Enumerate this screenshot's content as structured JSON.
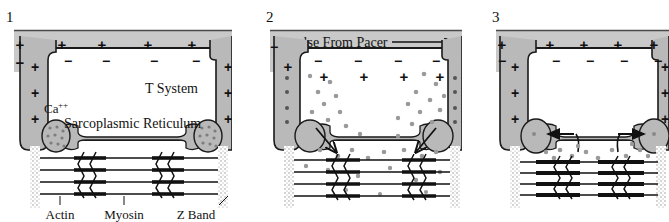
{
  "figure": {
    "panel_count": 3,
    "colors": {
      "sarcolemma_gray": "#c9c9c9",
      "membrane_gray": "#b3b3b3",
      "cisterna_gray": "#b9b9b9",
      "calcium_dot": "#9a9a9a",
      "stroke": "#1a1a1a",
      "background": "#ffffff"
    }
  },
  "panels": [
    {
      "number": "1",
      "state": "resting",
      "outside_charges": [
        "+",
        "+",
        "+",
        "+",
        "+"
      ],
      "inside_charges": [
        "-",
        "-",
        "-",
        "-"
      ],
      "left_edge_charges": [
        "+",
        "-"
      ],
      "tubule_charges": [
        "+",
        "+",
        "+"
      ],
      "labels": {
        "t_system": "T System",
        "calcium": "Ca",
        "calcium_superscript": "++",
        "sarcoplasmic_reticulum": "Sarcoplasmic Reticulum",
        "actin": "Actin",
        "myosin": "Myosin",
        "z_band": "Z Band"
      },
      "free_calcium_dots": 0,
      "cisterna_stored_calcium": true,
      "arrows": []
    },
    {
      "number": "2",
      "state": "depolarized-calcium-release",
      "impulse_label": "Impulse From Pacer",
      "outside_charges": [
        "-",
        "-",
        "-",
        "-"
      ],
      "inside_charges": [
        "+",
        "+",
        "+",
        "+"
      ],
      "left_edge_charges": [
        "-",
        "+"
      ],
      "tubule_charges": [
        "-",
        "-",
        "-",
        "-"
      ],
      "free_calcium_dots": 46,
      "cisterna_stored_calcium": false,
      "arrows": [
        "release-left-down",
        "release-right-down"
      ]
    },
    {
      "number": "3",
      "state": "repolarized-calcium-reuptake",
      "outside_charges": [
        "+",
        "+",
        "+",
        "+",
        "+"
      ],
      "inside_charges": [
        "-",
        "-",
        "-",
        "-"
      ],
      "left_edge_charges": [
        "-",
        "+"
      ],
      "tubule_charges": [
        "+",
        "+",
        "+"
      ],
      "free_calcium_dots": 18,
      "cisterna_stored_calcium": true,
      "arrows": [
        "reuptake-left",
        "reuptake-right"
      ]
    }
  ]
}
